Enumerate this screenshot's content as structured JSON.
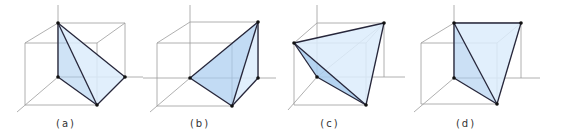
{
  "figure": {
    "panels": [
      {
        "id": "a",
        "label": "(a)"
      },
      {
        "id": "b",
        "label": "(b)"
      },
      {
        "id": "c",
        "label": "(c)"
      },
      {
        "id": "d",
        "label": "(d)"
      }
    ]
  },
  "colors": {
    "face_light": "#dcecfb",
    "face_dark": "#a8ccef",
    "edge": "#26263a",
    "cube_lines": "#9c9c9c"
  }
}
